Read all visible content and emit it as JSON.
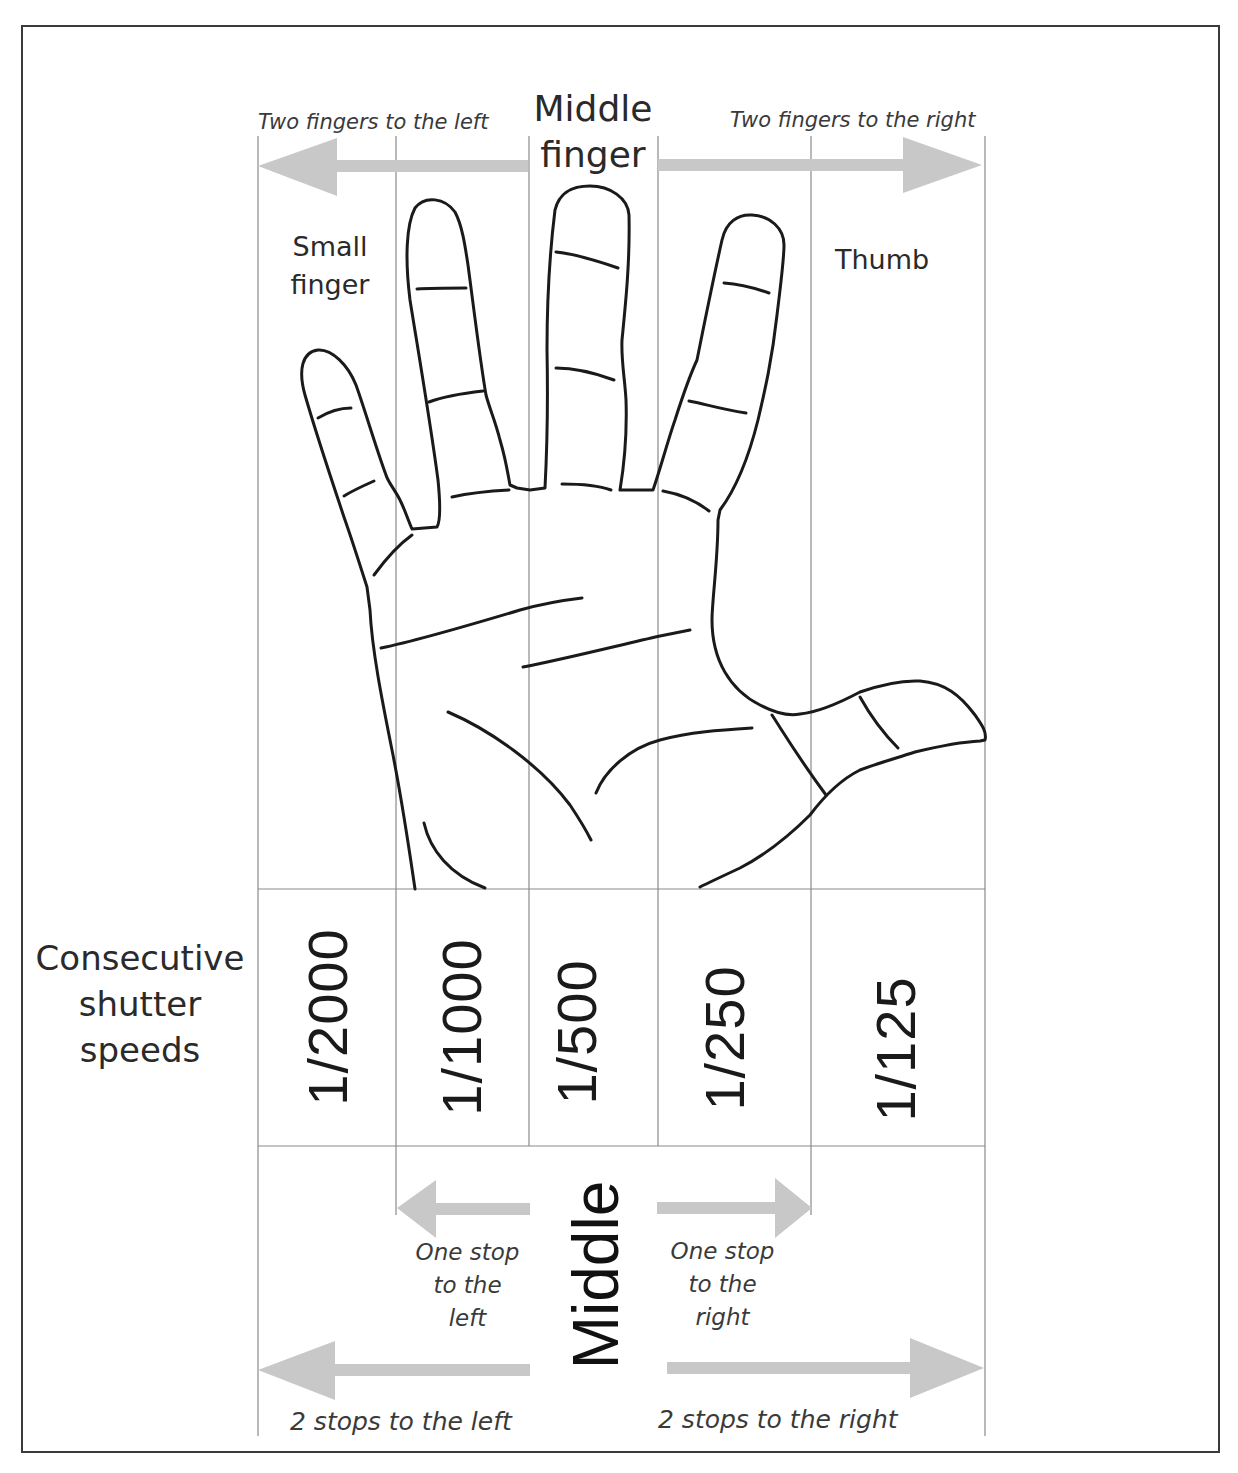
{
  "diagram": {
    "top": {
      "left_arrow_label": "Two fingers to the left",
      "center_label_line1": "Middle",
      "center_label_line2": "finger",
      "right_arrow_label": "Two fingers to the right"
    },
    "fingers": {
      "small_line1": "Small",
      "small_line2": "finger",
      "thumb": "Thumb"
    },
    "row_label": {
      "line1": "Consecutive",
      "line2": "shutter",
      "line3": "speeds"
    },
    "shutter_speeds": [
      "1/2000",
      "1/1000",
      "1/500",
      "1/250",
      "1/125"
    ],
    "bottom": {
      "middle_label": "Middle",
      "one_stop_left": [
        "One stop",
        "to the",
        "left"
      ],
      "one_stop_right": [
        "One stop",
        "to the",
        "right"
      ],
      "two_stops_left": "2 stops to the left",
      "two_stops_right": "2 stops to the right"
    },
    "colors": {
      "arrow": "#c8c8c8",
      "grid_line": "#8a8a8a",
      "outline": "#1a1a1a",
      "frame": "#3a3a3a"
    }
  }
}
